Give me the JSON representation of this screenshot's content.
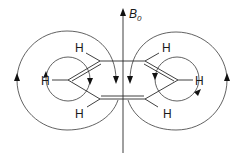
{
  "diagram": {
    "field": {
      "label": "B",
      "subscript": "0"
    },
    "hydrogens": {
      "top_left": "H",
      "left": "H",
      "bottom_left": "H",
      "top_right": "H",
      "right": "H",
      "bottom_right": "H"
    },
    "colors": {
      "stroke": "#2a2a2a",
      "background": "#ffffff"
    }
  }
}
